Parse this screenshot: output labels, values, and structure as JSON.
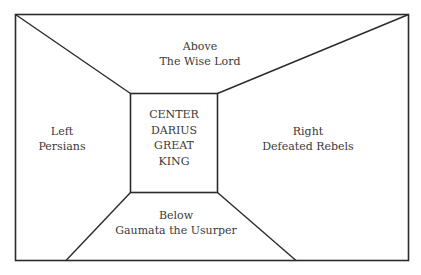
{
  "diagram": {
    "regions": {
      "above": {
        "line1": "Above",
        "line2": "The Wise Lord"
      },
      "left": {
        "line1": "Left",
        "line2": "Persians"
      },
      "right": {
        "line1": "Right",
        "line2": "Defeated Rebels"
      },
      "below": {
        "line1": "Below",
        "line2": "Gaumata the Usurper"
      },
      "center": {
        "line1": "CENTER",
        "line2": "DARIUS",
        "line3": "GREAT",
        "line4": "KING"
      }
    },
    "colors": {
      "line": "#2b2b2b",
      "text": "#3a3a3a",
      "background": "#ffffff"
    }
  }
}
